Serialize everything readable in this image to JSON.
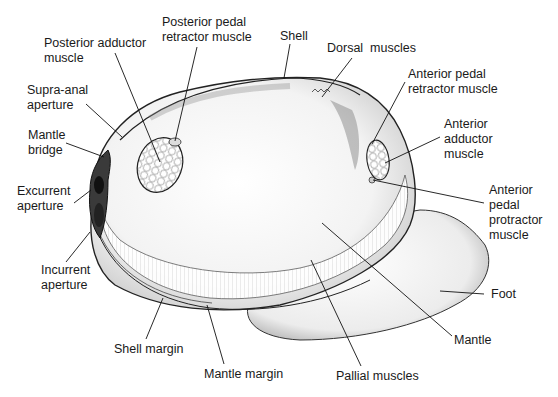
{
  "diagram": {
    "labels": [
      {
        "id": "posterior-adductor-muscle",
        "text": "Posterior adductor\nmuscle",
        "x": 44,
        "y": 36
      },
      {
        "id": "posterior-pedal-retractor-muscle",
        "text": "Posterior pedal\nretractor muscle",
        "x": 162,
        "y": 15
      },
      {
        "id": "shell",
        "text": "Shell",
        "x": 280,
        "y": 29
      },
      {
        "id": "dorsal-muscles",
        "text": "Dorsal  muscles",
        "x": 327,
        "y": 41
      },
      {
        "id": "anterior-pedal-retractor-muscle",
        "text": "Anterior pedal\nretractor muscle",
        "x": 408,
        "y": 67
      },
      {
        "id": "anterior-adductor-muscle",
        "text": "Anterior\nadductor\nmuscle",
        "x": 444,
        "y": 117
      },
      {
        "id": "supra-anal-aperture",
        "text": "Supra-anal\naperture",
        "x": 27,
        "y": 83
      },
      {
        "id": "mantle-bridge",
        "text": "Mantle\nbridge",
        "x": 28,
        "y": 128
      },
      {
        "id": "excurrent-aperture",
        "text": "Excurrent\naperture",
        "x": 17,
        "y": 184
      },
      {
        "id": "anterior-pedal-protractor-muscle",
        "text": "Anterior\npedal\nprotractor\nmuscle",
        "x": 489,
        "y": 183
      },
      {
        "id": "incurrent-aperture",
        "text": "Incurrent\naperture",
        "x": 41,
        "y": 263
      },
      {
        "id": "foot",
        "text": "Foot",
        "x": 491,
        "y": 287
      },
      {
        "id": "shell-margin",
        "text": "Shell margin",
        "x": 114,
        "y": 342
      },
      {
        "id": "mantle",
        "text": "Mantle",
        "x": 454,
        "y": 333
      },
      {
        "id": "mantle-margin",
        "text": "Mantle margin",
        "x": 204,
        "y": 367
      },
      {
        "id": "pallial-muscles",
        "text": "Pallial muscles",
        "x": 336,
        "y": 369
      }
    ],
    "leader_lines": [
      {
        "for": "posterior-adductor-muscle",
        "x1": 115,
        "y1": 53,
        "x2": 160,
        "y2": 162
      },
      {
        "for": "posterior-pedal-retractor-muscle",
        "x1": 197,
        "y1": 47,
        "x2": 175,
        "y2": 141
      },
      {
        "for": "shell",
        "x1": 290,
        "y1": 44,
        "x2": 284,
        "y2": 78
      },
      {
        "for": "dorsal-muscles",
        "x1": 352,
        "y1": 58,
        "x2": 322,
        "y2": 97
      },
      {
        "for": "anterior-pedal-retractor-muscle",
        "x1": 405,
        "y1": 82,
        "x2": 372,
        "y2": 144
      },
      {
        "for": "anterior-adductor-muscle",
        "x1": 440,
        "y1": 137,
        "x2": 385,
        "y2": 163
      },
      {
        "for": "supra-anal-aperture",
        "x1": 86,
        "y1": 104,
        "x2": 122,
        "y2": 137
      },
      {
        "for": "mantle-bridge",
        "x1": 66,
        "y1": 143,
        "x2": 104,
        "y2": 157
      },
      {
        "for": "excurrent-aperture",
        "x1": 74,
        "y1": 203,
        "x2": 91,
        "y2": 190
      },
      {
        "for": "anterior-pedal-protractor-muscle",
        "x1": 484,
        "y1": 203,
        "x2": 373,
        "y2": 180
      },
      {
        "for": "incurrent-aperture",
        "x1": 66,
        "y1": 262,
        "x2": 90,
        "y2": 232
      },
      {
        "for": "foot",
        "x1": 484,
        "y1": 294,
        "x2": 440,
        "y2": 291
      },
      {
        "for": "shell-margin",
        "x1": 146,
        "y1": 339,
        "x2": 163,
        "y2": 298
      },
      {
        "for": "mantle",
        "x1": 452,
        "y1": 336,
        "x2": 322,
        "y2": 223
      },
      {
        "for": "mantle-margin",
        "x1": 224,
        "y1": 364,
        "x2": 207,
        "y2": 305
      },
      {
        "for": "pallial-muscles",
        "x1": 361,
        "y1": 366,
        "x2": 311,
        "y2": 260
      }
    ]
  }
}
